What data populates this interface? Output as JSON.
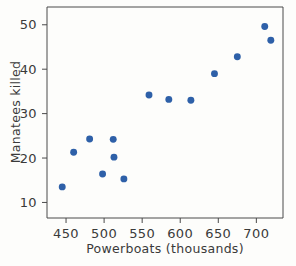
{
  "chart_data": {
    "type": "scatter",
    "title": "",
    "xlabel": "Powerboats (thousands)",
    "ylabel": "Manatees killed",
    "xlim": [
      425,
      735
    ],
    "ylim": [
      6.5,
      54
    ],
    "xticks": [
      450,
      500,
      550,
      600,
      650,
      700
    ],
    "yticks": [
      10,
      20,
      30,
      40,
      50
    ],
    "xticklabels": [
      "450",
      "500",
      "550",
      "600",
      "650",
      "700"
    ],
    "yticklabels": [
      "10",
      "20",
      "30",
      "40",
      "50"
    ],
    "grid": false,
    "legend": null,
    "marker_color": "#2e60a8",
    "marker_size": 5,
    "points": [
      {
        "x": 445,
        "y": 13.5
      },
      {
        "x": 460,
        "y": 21.3
      },
      {
        "x": 481,
        "y": 24.3
      },
      {
        "x": 498,
        "y": 16.4
      },
      {
        "x": 512,
        "y": 24.2
      },
      {
        "x": 513,
        "y": 20.2
      },
      {
        "x": 526,
        "y": 15.3
      },
      {
        "x": 559,
        "y": 34.2
      },
      {
        "x": 585,
        "y": 33.2
      },
      {
        "x": 614,
        "y": 33.0
      },
      {
        "x": 645,
        "y": 39.0
      },
      {
        "x": 675,
        "y": 42.8
      },
      {
        "x": 711,
        "y": 49.6
      },
      {
        "x": 719,
        "y": 46.5
      }
    ]
  },
  "figure": {
    "background_color": "#fdfdfb",
    "axis_color": "#4a4a4a",
    "text_color": "#3a3a3a"
  }
}
